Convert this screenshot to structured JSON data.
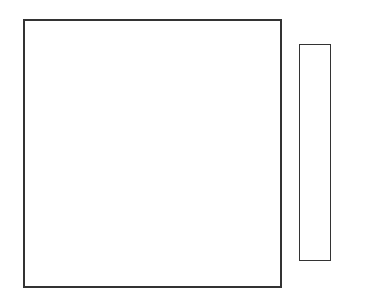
{
  "chart_data": {
    "type": "heatmap",
    "title": "",
    "xlabel": "",
    "ylabel": "",
    "colorbar": {
      "min": 0,
      "max": 30,
      "ticks": [
        0,
        6,
        12,
        18,
        24,
        30
      ],
      "tick_labels": [
        "0",
        "6",
        "12",
        "18",
        "24",
        "30"
      ],
      "colormap": "white-to-black grayscale"
    },
    "grid_rows": 16,
    "grid_cols": 16,
    "values": [
      [
        3,
        6,
        6,
        3,
        0,
        0,
        0,
        0,
        4,
        10,
        17,
        18,
        10,
        7,
        8,
        8
      ],
      [
        1,
        3,
        3,
        1,
        0,
        0,
        1,
        2,
        6,
        12,
        14,
        10,
        6,
        5,
        7,
        7
      ],
      [
        0,
        0,
        0,
        0,
        0,
        1,
        3,
        4,
        9,
        13,
        10,
        4,
        0,
        0,
        1,
        1
      ],
      [
        0,
        0,
        0,
        0,
        0,
        2,
        4,
        5,
        10,
        11,
        6,
        1,
        0,
        0,
        0,
        0
      ],
      [
        0,
        0,
        0,
        2,
        4,
        5,
        5,
        6,
        10,
        9,
        4,
        3,
        3,
        2,
        1,
        1
      ],
      [
        0,
        0,
        4,
        8,
        9,
        7,
        4,
        7,
        10,
        8,
        3,
        10,
        12,
        9,
        8,
        8
      ],
      [
        0,
        0,
        6,
        10,
        10,
        6,
        2,
        7,
        11,
        6,
        5,
        16,
        19,
        10,
        7,
        7
      ],
      [
        0,
        0,
        5,
        8,
        7,
        3,
        1,
        5,
        8,
        4,
        4,
        14,
        14,
        7,
        3,
        2
      ],
      [
        0,
        0,
        1,
        2,
        1,
        0,
        0,
        2,
        4,
        1,
        1,
        2,
        2,
        1,
        0,
        0
      ],
      [
        0,
        0,
        0,
        0,
        0,
        0,
        0,
        0,
        1,
        0,
        0,
        0,
        0,
        0,
        0,
        0
      ],
      [
        2,
        1,
        0,
        0,
        0,
        0,
        0,
        0,
        0,
        0,
        0,
        0,
        0,
        0,
        1,
        2
      ],
      [
        2,
        1,
        0,
        0,
        0,
        2,
        4,
        1,
        0,
        0,
        0,
        0,
        0,
        0,
        2,
        3
      ],
      [
        10,
        5,
        2,
        0,
        0,
        2,
        3,
        1,
        0,
        0,
        0,
        0,
        0,
        0,
        5,
        7
      ],
      [
        20,
        12,
        6,
        1,
        0,
        0,
        0,
        1,
        2,
        1,
        0,
        0,
        0,
        2,
        9,
        9
      ],
      [
        18,
        10,
        5,
        1,
        0,
        0,
        0,
        1,
        2,
        2,
        1,
        0,
        0,
        1,
        7,
        8
      ],
      [
        6,
        3,
        1,
        0,
        0,
        0,
        0,
        0,
        1,
        2,
        2,
        1,
        0,
        0,
        2,
        4
      ]
    ]
  }
}
